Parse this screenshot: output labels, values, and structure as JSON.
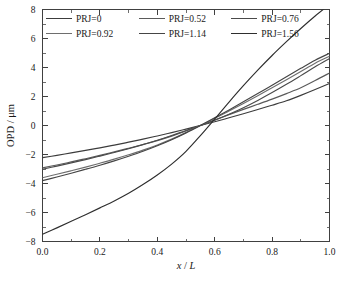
{
  "chart_data": {
    "type": "line",
    "title": "",
    "xlabel": "x / L",
    "xlabel_parts": {
      "italic": "x",
      "slash": "/",
      "italic2": "L"
    },
    "ylabel": "OPD / μm",
    "xlim": [
      0.0,
      1.0
    ],
    "ylim": [
      -8,
      8
    ],
    "xticks": [
      "0.0",
      "0.2",
      "0.4",
      "0.6",
      "0.8",
      "1.0"
    ],
    "xtick_values": [
      0.0,
      0.2,
      0.4,
      0.6,
      0.8,
      1.0
    ],
    "yticks": [
      "8",
      "6",
      "4",
      "2",
      "0",
      "−2",
      "−4",
      "−6",
      "−8"
    ],
    "ytick_values": [
      8,
      6,
      4,
      2,
      0,
      -2,
      -4,
      -6,
      -8
    ],
    "grid": false,
    "legend_position": "top-inside",
    "x": [
      0.0,
      0.05,
      0.1,
      0.15,
      0.2,
      0.25,
      0.3,
      0.35,
      0.4,
      0.45,
      0.5,
      0.55,
      0.6,
      0.65,
      0.7,
      0.75,
      0.8,
      0.85,
      0.9,
      0.95,
      1.0
    ],
    "series": [
      {
        "name": "PRJ=0",
        "color": "#3c3c3c",
        "values": [
          -2.22,
          -2.06,
          -1.89,
          -1.72,
          -1.54,
          -1.35,
          -1.15,
          -0.94,
          -0.72,
          -0.49,
          -0.25,
          0.0,
          0.26,
          0.53,
          0.81,
          1.1,
          1.4,
          1.71,
          2.08,
          2.48,
          2.9
        ]
      },
      {
        "name": "PRJ=0.52",
        "color": "#5a5a5a",
        "values": [
          -2.92,
          -2.72,
          -2.51,
          -2.29,
          -2.06,
          -1.82,
          -1.57,
          -1.31,
          -1.04,
          -0.73,
          -0.38,
          0.0,
          0.38,
          0.75,
          1.11,
          1.46,
          1.82,
          2.2,
          2.6,
          3.1,
          3.62
        ]
      },
      {
        "name": "PRJ=0.76",
        "color": "#4a4a4a",
        "values": [
          -3.02,
          -2.8,
          -2.58,
          -2.35,
          -2.11,
          -1.86,
          -1.6,
          -1.32,
          -1.02,
          -0.69,
          -0.34,
          0.0,
          0.37,
          0.78,
          1.23,
          1.73,
          2.27,
          2.84,
          3.44,
          4.05,
          4.62
        ]
      },
      {
        "name": "PRJ=0.92",
        "color": "#6e6e6e",
        "values": [
          -3.6,
          -3.36,
          -3.12,
          -2.87,
          -2.6,
          -2.32,
          -2.02,
          -1.7,
          -1.34,
          -0.94,
          -0.49,
          0.0,
          0.5,
          1.0,
          1.52,
          2.05,
          2.6,
          3.15,
          3.72,
          4.3,
          4.78
        ]
      },
      {
        "name": "PRJ=1.14",
        "color": "#454545",
        "values": [
          -3.8,
          -3.55,
          -3.29,
          -3.02,
          -2.74,
          -2.44,
          -2.12,
          -1.78,
          -1.4,
          -0.98,
          -0.51,
          0.0,
          0.53,
          1.07,
          1.63,
          2.2,
          2.78,
          3.36,
          3.94,
          4.5,
          4.98
        ]
      },
      {
        "name": "PRJ=1.56",
        "color": "#2e2e2e",
        "values": [
          -7.5,
          -7.06,
          -6.61,
          -6.15,
          -5.68,
          -5.2,
          -4.67,
          -4.07,
          -3.41,
          -2.66,
          -1.78,
          -0.7,
          0.45,
          1.62,
          2.75,
          3.82,
          4.83,
          5.78,
          6.69,
          7.55,
          8.35
        ]
      }
    ]
  }
}
